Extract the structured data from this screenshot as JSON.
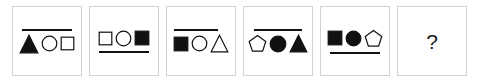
{
  "puzzle": {
    "type": "visual-analogy-sequence",
    "panel_count": 6,
    "question_symbol": "?",
    "colors": {
      "panel_border": "#d2d2d2",
      "panel_background": "#ffffff",
      "shape_stroke": "#111111",
      "shape_fill_solid": "#111111",
      "shape_fill_hollow": "#ffffff",
      "bar": "#111111",
      "question_text": "#1a1a1a"
    },
    "panels": [
      {
        "index": 1,
        "name": "panel-1",
        "bar": {
          "present": true,
          "position": "top",
          "width": 50,
          "offset": 0
        },
        "shapes": [
          {
            "kind": "triangle",
            "fill": "solid",
            "size": 20
          },
          {
            "kind": "circle",
            "fill": "hollow",
            "size": 17
          },
          {
            "kind": "square",
            "fill": "hollow",
            "size": 15
          }
        ]
      },
      {
        "index": 2,
        "name": "panel-2",
        "bar": {
          "present": true,
          "position": "bottom",
          "width": 50,
          "offset": 0
        },
        "shapes": [
          {
            "kind": "square",
            "fill": "hollow",
            "size": 15
          },
          {
            "kind": "circle",
            "fill": "hollow",
            "size": 17
          },
          {
            "kind": "square",
            "fill": "solid",
            "size": 16
          }
        ]
      },
      {
        "index": 3,
        "name": "panel-3",
        "bar": {
          "present": true,
          "position": "top",
          "width": 44,
          "offset": -5
        },
        "shapes": [
          {
            "kind": "square",
            "fill": "solid",
            "size": 16
          },
          {
            "kind": "circle",
            "fill": "hollow",
            "size": 17
          },
          {
            "kind": "triangle",
            "fill": "hollow",
            "size": 19
          }
        ]
      },
      {
        "index": 4,
        "name": "panel-4",
        "bar": {
          "present": true,
          "position": "top",
          "width": 48,
          "offset": 0
        },
        "shapes": [
          {
            "kind": "pentagon",
            "fill": "hollow",
            "size": 19
          },
          {
            "kind": "circle",
            "fill": "solid",
            "size": 18
          },
          {
            "kind": "triangle",
            "fill": "solid",
            "size": 19
          }
        ]
      },
      {
        "index": 5,
        "name": "panel-5",
        "bar": {
          "present": true,
          "position": "bottom",
          "width": 50,
          "offset": 0
        },
        "shapes": [
          {
            "kind": "square",
            "fill": "solid",
            "size": 16
          },
          {
            "kind": "circle",
            "fill": "solid",
            "size": 17
          },
          {
            "kind": "pentagon",
            "fill": "hollow",
            "size": 19
          }
        ]
      },
      {
        "index": 6,
        "name": "panel-6-answer",
        "bar": {
          "present": false,
          "position": "none",
          "width": 0,
          "offset": 0
        },
        "shapes": [],
        "placeholder": "?"
      }
    ]
  }
}
